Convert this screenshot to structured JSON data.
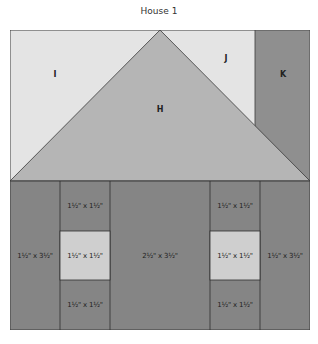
{
  "title": "House 1",
  "colors": {
    "light": "#e4e4e4",
    "roof": "#b5b5b5",
    "dark": "#858585",
    "window": "#cfcfcf",
    "line": "#3a3a3a"
  },
  "roof": {
    "pieces": [
      {
        "id": "I",
        "label": "I"
      },
      {
        "id": "H",
        "label": "H"
      },
      {
        "id": "J",
        "label": "J"
      },
      {
        "id": "K",
        "label": "K"
      }
    ]
  },
  "house": {
    "left_wall": "1½\" x 3½\"",
    "left_top": "1½\" x 1½\"",
    "left_window": "1½\" x 1½\"",
    "left_bottom": "1½\" x 1½\"",
    "center_door": "2½\" x 3½\"",
    "right_top": "1½\" x 1½\"",
    "right_window": "1½\" x 1½\"",
    "right_bottom": "1½\" x 1½\"",
    "right_wall": "1½\" x 3½\""
  }
}
